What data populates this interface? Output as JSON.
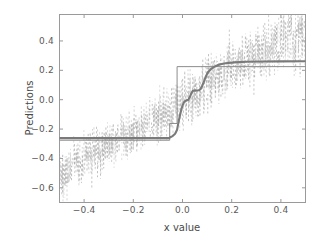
{
  "chart_data": {
    "type": "line",
    "title": "",
    "xlabel": "x value",
    "ylabel": "Predictions",
    "xlim": [
      -0.5,
      0.5
    ],
    "ylim": [
      -0.7,
      0.58
    ],
    "xticks": [
      -0.4,
      -0.2,
      0.0,
      0.2,
      0.4
    ],
    "xticklabels": [
      "−0.4",
      "−0.2",
      "0.0",
      "0.2",
      "0.4"
    ],
    "yticks": [
      0.4,
      0.2,
      0.0,
      -0.2,
      -0.4,
      -0.6
    ],
    "yticklabels": [
      "0.4",
      "0.2",
      "0.0",
      "−0.2",
      "−0.4",
      "−0.6"
    ],
    "grid": false,
    "legend": "none",
    "colors": {
      "thick_step": "#7a7a7a",
      "thin_step": "#8c8c8c",
      "noise": "#a8a8a8",
      "axis": "#9a9a9a"
    },
    "series": [
      {
        "name": "smoothed step prediction",
        "style": "solid-thick",
        "color": "#7a7a7a",
        "x": [
          -0.5,
          -0.055,
          -0.05,
          -0.04,
          -0.03,
          -0.022,
          -0.018,
          -0.012,
          -0.006,
          0.0,
          0.006,
          0.012,
          0.018,
          0.024,
          0.03,
          0.036,
          0.042,
          0.048,
          0.054,
          0.06,
          0.066,
          0.072,
          0.078,
          0.086,
          0.094,
          0.104,
          0.118,
          0.134,
          0.15,
          0.175,
          0.21,
          0.26,
          0.32,
          0.4,
          0.5
        ],
        "y": [
          -0.262,
          -0.262,
          -0.256,
          -0.248,
          -0.232,
          -0.205,
          -0.168,
          -0.12,
          -0.075,
          -0.04,
          -0.018,
          -0.008,
          -0.004,
          0.0,
          0.018,
          0.045,
          0.06,
          0.062,
          0.062,
          0.063,
          0.064,
          0.07,
          0.085,
          0.118,
          0.155,
          0.188,
          0.212,
          0.228,
          0.24,
          0.248,
          0.254,
          0.258,
          0.26,
          0.261,
          0.262
        ]
      },
      {
        "name": "hard step prediction",
        "style": "solid-thin",
        "color": "#8c8c8c",
        "x": [
          -0.5,
          -0.052,
          -0.052,
          -0.022,
          -0.022,
          0.075,
          0.075,
          0.5
        ],
        "y": [
          -0.276,
          -0.276,
          -0.162,
          -0.162,
          0.225,
          0.225,
          0.225,
          0.225
        ]
      },
      {
        "name": "noisy observations (dashed)",
        "style": "dashed-scatter",
        "color": "#a8a8a8",
        "description": "vertical dashed noise segments scattered about an increasing trend from about -0.62 at x=-0.48 up to about 0.55 at x=0.49",
        "trend_x": [
          -0.5,
          -0.4,
          -0.3,
          -0.2,
          -0.1,
          0.0,
          0.1,
          0.2,
          0.3,
          0.4,
          0.5
        ],
        "trend_y": [
          -0.52,
          -0.4,
          -0.31,
          -0.22,
          -0.13,
          -0.02,
          0.11,
          0.22,
          0.31,
          0.39,
          0.46
        ],
        "spread": [
          0.1,
          0.09,
          0.09,
          0.08,
          0.09,
          0.11,
          0.11,
          0.12,
          0.12,
          0.13,
          0.13
        ]
      }
    ]
  },
  "axes": {
    "x_title": "x value",
    "y_title": "Predictions"
  }
}
